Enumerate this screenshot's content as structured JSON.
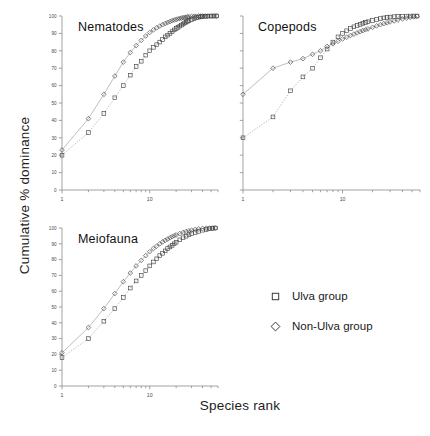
{
  "axes": {
    "ylabel": "Cumulative % dominance",
    "xlabel": "Species rank"
  },
  "legend": {
    "items": [
      {
        "label": "Ulva group",
        "marker": "square",
        "marker_name": "square-marker-icon"
      },
      {
        "label": "Non-Ulva group",
        "marker": "diamond",
        "marker_name": "diamond-marker-icon"
      }
    ]
  },
  "panels": [
    {
      "id": "nematodes",
      "title": "Nematodes"
    },
    {
      "id": "copepods",
      "title": "Copepods"
    },
    {
      "id": "meiofauna",
      "title": "Meiofauna"
    }
  ],
  "chart_data": {
    "type": "line",
    "title": "",
    "xlabel": "Species rank",
    "ylabel": "Cumulative % dominance",
    "xscale": "log",
    "xlim": [
      1,
      60
    ],
    "ylim": [
      0,
      100
    ],
    "yticks": [
      0,
      10,
      20,
      30,
      40,
      50,
      60,
      70,
      80,
      90,
      100
    ],
    "xticks": [
      1,
      10
    ],
    "xticklabels": [
      "1",
      "10"
    ],
    "grid": false,
    "legend_position": "lower-right",
    "panels": [
      {
        "name": "Nematodes",
        "series": [
          {
            "name": "Ulva group",
            "marker": "square",
            "x": [
              1,
              2,
              3,
              4,
              5,
              6,
              7,
              8,
              9,
              10,
              11,
              12,
              13,
              14,
              15,
              16,
              17,
              18,
              19,
              20,
              21,
              22,
              23,
              24,
              25,
              26,
              27,
              28,
              30,
              32,
              34,
              36,
              38,
              40,
              43,
              46,
              50,
              54,
              58
            ],
            "y": [
              20,
              33,
              44,
              53,
              60,
              66,
              71,
              74,
              77.5,
              80,
              82,
              83.5,
              85,
              86.5,
              88,
              89,
              90,
              91,
              92,
              92.8,
              93.5,
              94.2,
              94.8,
              95.4,
              96,
              96.5,
              97,
              97.4,
              98,
              98.5,
              99,
              99.3,
              99.5,
              99.7,
              99.85,
              99.92,
              99.97,
              100,
              100
            ]
          },
          {
            "name": "Non-Ulva group",
            "marker": "diamond",
            "x": [
              1,
              2,
              3,
              4,
              5,
              6,
              7,
              8,
              9,
              10,
              11,
              12,
              13,
              14,
              15,
              16,
              17,
              18,
              19,
              20,
              21,
              22,
              23,
              24,
              25,
              26,
              27,
              28,
              30,
              32,
              34,
              36,
              38,
              40,
              43,
              46,
              50,
              54,
              58
            ],
            "y": [
              23,
              41,
              55,
              65.5,
              73.5,
              79,
              83,
              86,
              88.5,
              90.5,
              92,
              93.2,
              94.2,
              95,
              95.7,
              96.3,
              96.8,
              97.3,
              97.7,
              98,
              98.3,
              98.6,
              98.8,
              99,
              99.2,
              99.35,
              99.5,
              99.6,
              99.75,
              99.85,
              99.9,
              99.94,
              99.97,
              99.99,
              100,
              100,
              100,
              100,
              100
            ]
          }
        ]
      },
      {
        "name": "Copepods",
        "series": [
          {
            "name": "Ulva group",
            "marker": "square",
            "x": [
              1,
              2,
              3,
              4,
              5,
              6,
              7,
              8,
              9,
              10,
              11,
              12,
              13,
              14,
              15,
              16,
              17,
              18,
              20,
              22,
              24,
              26,
              28,
              30,
              33,
              36,
              40,
              44,
              48,
              52,
              56
            ],
            "y": [
              30,
              42,
              57,
              65,
              70,
              76,
              81,
              85,
              88,
              90,
              91.5,
              92.8,
              93.8,
              94.6,
              95.2,
              95.8,
              96.3,
              96.7,
              97.4,
              98,
              98.5,
              98.9,
              99.2,
              99.4,
              99.6,
              99.75,
              99.88,
              99.94,
              99.97,
              100,
              100
            ]
          },
          {
            "name": "Non-Ulva group",
            "marker": "diamond",
            "x": [
              1,
              2,
              3,
              4,
              5,
              6,
              7,
              8,
              9,
              10,
              11,
              12,
              13,
              14,
              15,
              16,
              17,
              18,
              20,
              22,
              24,
              26,
              28,
              30,
              33,
              36,
              40,
              44,
              48,
              52,
              56
            ],
            "y": [
              55,
              70,
              73.5,
              75.5,
              78,
              80,
              82.5,
              84,
              85.5,
              86.8,
              87.8,
              88.8,
              89.6,
              90.3,
              91,
              91.6,
              92.1,
              92.6,
              93.5,
              94.3,
              95,
              95.6,
              96.1,
              96.6,
              97.2,
              97.7,
              98.3,
              98.8,
              99.2,
              99.5,
              99.8
            ]
          }
        ]
      },
      {
        "name": "Meiofauna",
        "series": [
          {
            "name": "Ulva group",
            "marker": "square",
            "x": [
              1,
              2,
              3,
              4,
              5,
              6,
              7,
              8,
              9,
              10,
              11,
              12,
              13,
              14,
              15,
              16,
              17,
              18,
              19,
              20,
              22,
              24,
              26,
              28,
              30,
              33,
              36,
              40,
              44,
              48,
              52,
              56
            ],
            "y": [
              18,
              30,
              41,
              49,
              56,
              62,
              66.5,
              70,
              73,
              76,
              78.5,
              80.5,
              82.5,
              84,
              85.5,
              87,
              88,
              89,
              90,
              91,
              92.5,
              93.8,
              94.8,
              95.7,
              96.4,
              97.2,
              97.9,
              98.6,
              99.1,
              99.5,
              99.8,
              100
            ]
          },
          {
            "name": "Non-Ulva group",
            "marker": "diamond",
            "x": [
              1,
              2,
              3,
              4,
              5,
              6,
              7,
              8,
              9,
              10,
              11,
              12,
              13,
              14,
              15,
              16,
              17,
              18,
              19,
              20,
              22,
              24,
              26,
              28,
              30,
              33,
              36,
              40,
              44,
              48,
              52,
              56
            ],
            "y": [
              21,
              37,
              49,
              58.5,
              66,
              71.5,
              76,
              79.5,
              82.5,
              85,
              87,
              88.5,
              90,
              91.2,
              92.2,
              93,
              93.8,
              94.5,
              95.1,
              95.6,
              96.5,
              97.2,
              97.8,
              98.2,
              98.6,
              99.1,
              99.4,
              99.7,
              99.85,
              99.95,
              100,
              100
            ]
          }
        ]
      }
    ]
  }
}
